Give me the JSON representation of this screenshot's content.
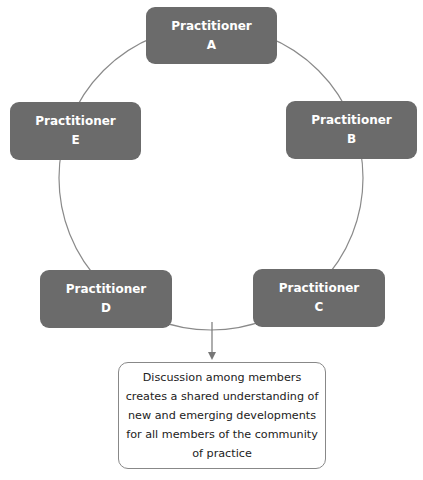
{
  "diagram": {
    "type": "cycle",
    "nodes": [
      {
        "id": "A",
        "title": "Practitioner",
        "letter": "A"
      },
      {
        "id": "B",
        "title": "Practitioner",
        "letter": "B"
      },
      {
        "id": "C",
        "title": "Practitioner",
        "letter": "C"
      },
      {
        "id": "D",
        "title": "Practitioner",
        "letter": "D"
      },
      {
        "id": "E",
        "title": "Practitioner",
        "letter": "E"
      }
    ],
    "outcome": "Discussion among members creates a shared understanding of new and emerging developments for all members of the community of practice",
    "colors": {
      "node_fill": "#6b6b6b",
      "node_text": "#ffffff",
      "line": "#888888"
    }
  }
}
